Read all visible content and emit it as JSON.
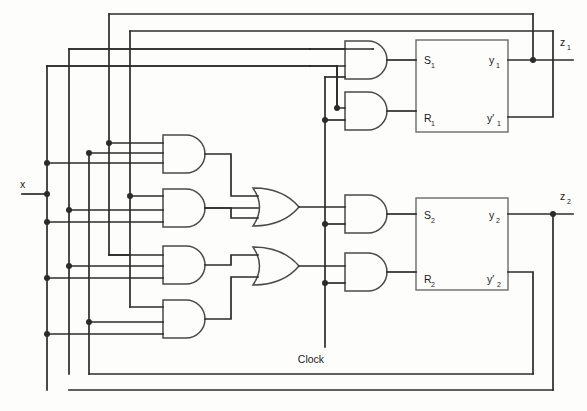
{
  "diagram": {
    "input_label": "x",
    "clock_label": "Clock",
    "outputs": [
      {
        "name": "z1",
        "base": "z",
        "sub": "1"
      },
      {
        "name": "z2",
        "base": "z",
        "sub": "2"
      }
    ],
    "flipflops": [
      {
        "id": "ff1",
        "pins": {
          "set": {
            "base": "S",
            "sub": "1"
          },
          "reset": {
            "base": "R",
            "sub": "1"
          },
          "q": {
            "base": "y",
            "sub": "1"
          },
          "qbar": {
            "base": "y′",
            "sub": "1"
          }
        }
      },
      {
        "id": "ff2",
        "pins": {
          "set": {
            "base": "S",
            "sub": "2"
          },
          "reset": {
            "base": "R",
            "sub": "2"
          },
          "q": {
            "base": "y",
            "sub": "2"
          },
          "qbar": {
            "base": "y′",
            "sub": "2"
          }
        }
      }
    ],
    "gates": {
      "and_product_terms": 4,
      "or_gates": 2,
      "and_clock_gates": 4
    },
    "colors": {
      "wire": "#2b2b2b",
      "gate_outline": "#4a4a4a",
      "box_outline": "#6a6a6a",
      "background": "#fdfdfb"
    }
  }
}
